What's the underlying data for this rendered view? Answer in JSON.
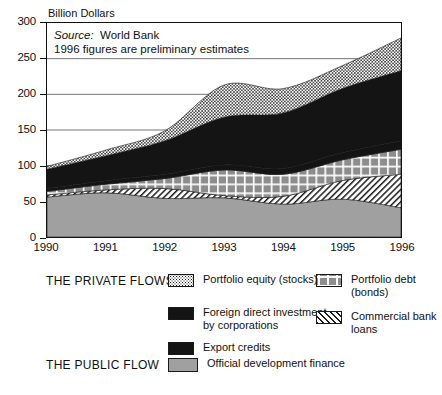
{
  "chart_data": {
    "type": "area",
    "title": "",
    "ylabel": "Billion Dollars",
    "xlabel": "",
    "ylim": [
      0,
      300
    ],
    "yticks": [
      0,
      50,
      100,
      150,
      200,
      250,
      300
    ],
    "grid": true,
    "legend_position": "below",
    "stacked": true,
    "categories": [
      "1990",
      "1991",
      "1992",
      "1993",
      "1994",
      "1995",
      "1996"
    ],
    "x": [
      1990,
      1991,
      1992,
      1993,
      1994,
      1995,
      1996
    ],
    "annotations": [
      "Source:  World Bank",
      "1996 figures are preliminary estimates"
    ],
    "series": [
      {
        "name": "Official development finance",
        "group": "THE PUBLIC FLOW",
        "pattern": "solid-gray",
        "color": "#a0a0a0",
        "values": [
          56,
          62,
          54,
          55,
          46,
          53,
          41
        ]
      },
      {
        "name": "Commercial bank loans",
        "group": "THE PRIVATE FLOWS",
        "pattern": "diagonal-hatch",
        "color": "#ffffff",
        "values": [
          3,
          4,
          14,
          3,
          11,
          26,
          47
        ]
      },
      {
        "name": "Portfolio debt (bonds)",
        "group": "THE PRIVATE FLOWS",
        "pattern": "grid",
        "color": "#8d8d8d",
        "values": [
          5,
          8,
          14,
          36,
          31,
          29,
          35
        ]
      },
      {
        "name": "Export credits",
        "group": "THE PRIVATE FLOWS",
        "pattern": "solid-black",
        "color": "#141414",
        "values": [
          4,
          5,
          6,
          7,
          8,
          10,
          12
        ]
      },
      {
        "name": "Foreign direct investment by corporations",
        "group": "THE PRIVATE FLOWS",
        "pattern": "solid-black",
        "color": "#141414",
        "values": [
          27,
          35,
          47,
          67,
          78,
          90,
          98
        ]
      },
      {
        "name": "Portfolio equity (stocks)",
        "group": "THE PRIVATE FLOWS",
        "pattern": "dots",
        "color": "#ffffff",
        "values": [
          4,
          8,
          14,
          45,
          34,
          32,
          46
        ]
      }
    ],
    "totals": [
      99,
      122,
      149,
      213,
      208,
      240,
      279
    ]
  },
  "chart": {
    "axis_title": "Billion Dollars",
    "source_prefix": "Source:",
    "source_value": "World Bank",
    "note": "1996 figures are preliminary estimates",
    "ytick_labels": [
      "300",
      "250",
      "200",
      "150",
      "100",
      "50",
      "0"
    ],
    "xtick_labels": [
      "1990",
      "1991",
      "1992",
      "1993",
      "1994",
      "1995",
      "1996"
    ]
  },
  "legend": {
    "groups": [
      {
        "title": "THE PRIVATE FLOWS"
      },
      {
        "title": "THE PUBLIC FLOW"
      }
    ],
    "entries": [
      {
        "label": "Portfolio equity (stocks)",
        "swatch": "dots"
      },
      {
        "label": "Portfolio debt (bonds)",
        "swatch": "grid"
      },
      {
        "label": "Foreign direct investment\nby corporations",
        "swatch": "solid-black"
      },
      {
        "label": "Commercial bank loans",
        "swatch": "diagonal-hatch"
      },
      {
        "label": "Export credits",
        "swatch": "solid-black"
      },
      {
        "label": "Official development finance",
        "swatch": "solid-gray"
      }
    ]
  },
  "colors": {
    "solid_black": "#141414",
    "solid_gray": "#a0a0a0",
    "grid_gray": "#8d8d8d",
    "axis": "#111111",
    "background": "#ffffff"
  }
}
